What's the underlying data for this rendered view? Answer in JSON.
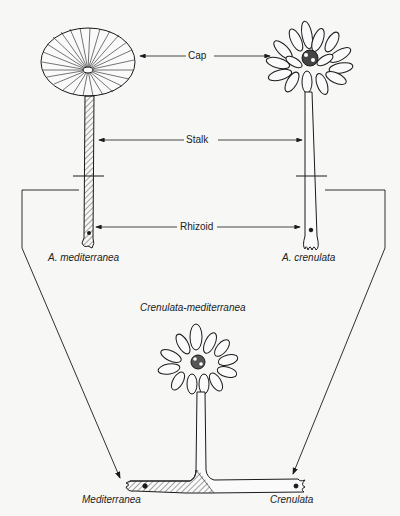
{
  "diagram": {
    "labels": {
      "cap": "Cap",
      "stalk": "Stalk",
      "rhizoid": "Rhizoid"
    },
    "species": {
      "left": "A. mediterranea",
      "right": "A. crenulata",
      "hybrid": "Crenulata-mediterranea",
      "bottom_left": "Mediterranea",
      "bottom_right": "Crenulata"
    },
    "colors": {
      "ink": "#1a1a1a",
      "background": "#f7f7f5"
    }
  }
}
